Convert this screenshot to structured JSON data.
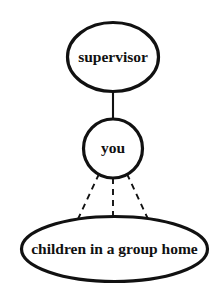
{
  "diagram": {
    "background_color": "#ffffff",
    "stroke_color": "#111111",
    "fill_color": "#ffffff",
    "nodes": [
      {
        "id": "supervisor",
        "label": "supervisor",
        "shape": "ellipse",
        "cx": 113,
        "cy": 57,
        "rx": 45.5,
        "ry": 34.5,
        "stroke_width": 3.2,
        "font_size": 15.5
      },
      {
        "id": "you",
        "label": "you",
        "shape": "circle",
        "cx": 113,
        "cy": 148.5,
        "rx": 29.5,
        "ry": 29.5,
        "stroke_width": 3.2,
        "font_size": 15.5
      },
      {
        "id": "children",
        "label": "children in a group home",
        "shape": "ellipse",
        "cx": 114.5,
        "cy": 249,
        "rx": 93,
        "ry": 32.5,
        "stroke_width": 3.2,
        "font_size": 15.5
      }
    ],
    "edges": [
      {
        "id": "supervisor-you",
        "style": "solid",
        "from": "supervisor",
        "to": "you",
        "x1": 113,
        "y1": 91,
        "x2": 113,
        "y2": 119,
        "stroke_width": 2.1,
        "dash": "none"
      },
      {
        "id": "you-children-left",
        "style": "dashed",
        "from": "you",
        "to": "children",
        "x1": 99,
        "y1": 174,
        "x2": 78,
        "y2": 219,
        "stroke_width": 1.9,
        "dash": "6 5"
      },
      {
        "id": "you-children-center",
        "style": "dashed",
        "from": "you",
        "to": "children",
        "x1": 113,
        "y1": 178,
        "x2": 113,
        "y2": 218,
        "stroke_width": 1.9,
        "dash": "6 5"
      },
      {
        "id": "you-children-right",
        "style": "dashed",
        "from": "you",
        "to": "children",
        "x1": 127,
        "y1": 174,
        "x2": 148,
        "y2": 219,
        "stroke_width": 1.9,
        "dash": "6 5"
      }
    ]
  }
}
